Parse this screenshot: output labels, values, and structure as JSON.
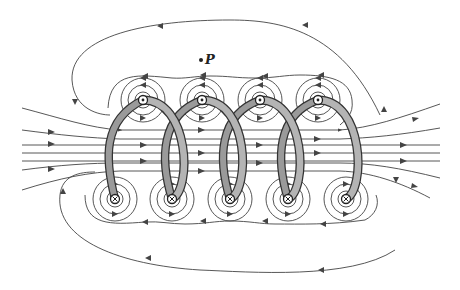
{
  "figure": {
    "point_label": "P",
    "colors": {
      "background": "#ffffff",
      "field_line": "#444444",
      "coil_outline": "#333333",
      "coil_fill": "#b4b4b4"
    },
    "coil": {
      "turns": 5,
      "top_wire_positions_x": [
        143,
        202,
        260,
        318
      ],
      "top_wire_y": 100,
      "top_wire_symbol": "dot-out-of-page",
      "bottom_wire_positions_x": [
        115,
        172,
        230,
        288,
        346
      ],
      "bottom_wire_y": 199,
      "bottom_wire_symbol": "cross-into-page"
    },
    "point_p": {
      "x": 203,
      "y": 60
    },
    "field_direction_inside": "left-to-right",
    "field_direction_outside": "right-to-left"
  }
}
